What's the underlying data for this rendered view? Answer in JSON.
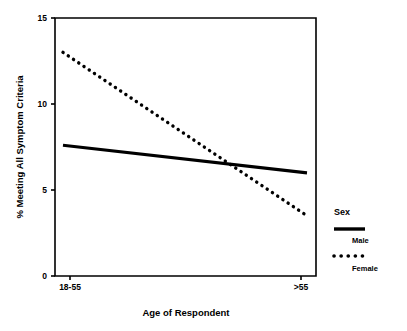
{
  "chart_data": {
    "type": "line",
    "title": "",
    "xlabel": "Age of Respondent",
    "ylabel": "% Meeting All Symptom Criteria",
    "categories": [
      "18-55",
      ">55"
    ],
    "x": [
      "18-55",
      ">55"
    ],
    "xtick_labels": [
      "18-55",
      ">55"
    ],
    "ytick_labels": [
      "0",
      "5",
      "10",
      "15"
    ],
    "yticks": [
      0,
      5,
      10,
      15
    ],
    "ylim": [
      0,
      15
    ],
    "grid": false,
    "legend_position": "right",
    "legend_title": "Sex",
    "series": [
      {
        "name": "Male",
        "style": "solid",
        "color": "#000000",
        "values": [
          7.6,
          6.0
        ]
      },
      {
        "name": "Female",
        "style": "dotted",
        "color": "#000000",
        "values": [
          13.0,
          3.5
        ]
      }
    ],
    "annotations": []
  },
  "axes": {
    "y_title": "% Meeting All Symptom Criteria",
    "x_title": "Age of Respondent",
    "y_tick_0": "0",
    "y_tick_5": "5",
    "y_tick_10": "10",
    "y_tick_15": "15",
    "x_tick_left": "18-55",
    "x_tick_right": ">55"
  },
  "legend": {
    "title": "Sex",
    "entries": [
      {
        "label": "Male",
        "style": "solid"
      },
      {
        "label": "Female",
        "style": "dotted"
      }
    ]
  }
}
